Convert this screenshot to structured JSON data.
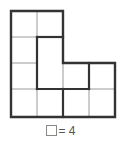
{
  "figure": {
    "grid": {
      "rows": [
        [
          1,
          1,
          0,
          0
        ],
        [
          1,
          1,
          0,
          0
        ],
        [
          1,
          1,
          1,
          1
        ],
        [
          1,
          1,
          1,
          1
        ]
      ]
    },
    "colors": {
      "thick_line": "#333333",
      "thin_line": "#999999"
    }
  },
  "legend": {
    "symbol": "unit-square",
    "equals": "= 4"
  }
}
